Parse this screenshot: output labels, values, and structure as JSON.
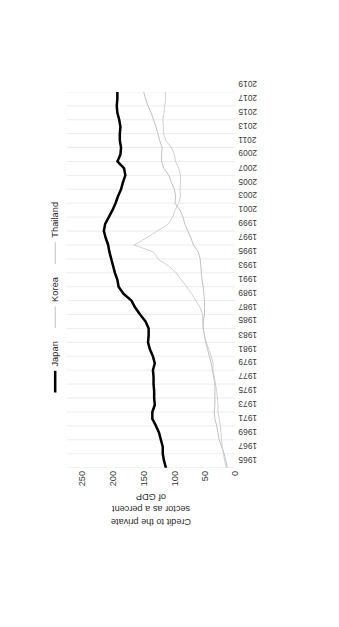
{
  "chart_data": {
    "type": "line",
    "title": "",
    "ylabel": "Credit to the private sector as a percent of GDP",
    "ylabel_lines": [
      "Credit to the private",
      "sector as a percent",
      "of GDP"
    ],
    "xlabel": "",
    "ylim": [
      0,
      275
    ],
    "yticks": [
      0,
      50,
      100,
      150,
      200,
      250
    ],
    "ytick_labels": [
      "0",
      "50",
      "100",
      "150",
      "200",
      "250"
    ],
    "grid": "vertical-light",
    "legend_position": "top-right",
    "rotation": "figure rotated 90 degrees counter-clockwise",
    "x": [
      1965,
      1966,
      1967,
      1968,
      1969,
      1970,
      1971,
      1972,
      1973,
      1974,
      1975,
      1976,
      1977,
      1978,
      1979,
      1980,
      1981,
      1982,
      1983,
      1984,
      1985,
      1986,
      1987,
      1988,
      1989,
      1990,
      1991,
      1992,
      1993,
      1994,
      1995,
      1996,
      1997,
      1998,
      1999,
      2000,
      2001,
      2002,
      2003,
      2004,
      2005,
      2006,
      2007,
      2008,
      2009,
      2010,
      2011,
      2012,
      2013,
      2014,
      2015,
      2016,
      2017,
      2018,
      2019
    ],
    "xtick_labels": [
      "1965",
      "1967",
      "1969",
      "1971",
      "1973",
      "1975",
      "1977",
      "1979",
      "1981",
      "1983",
      "1985",
      "1987",
      "1989",
      "1991",
      "1993",
      "1995",
      "1997",
      "1999",
      "2001",
      "2003",
      "2005",
      "2007",
      "2009",
      "2011",
      "2013",
      "2015",
      "2017",
      "2019"
    ],
    "series": [
      {
        "name": "Japan",
        "color": "#000000",
        "width": 3,
        "values": [
          113,
          116,
          118,
          118,
          121,
          124,
          129,
          135,
          135,
          131,
          132,
          132,
          133,
          133,
          134,
          131,
          134,
          139,
          142,
          141,
          141,
          146,
          155,
          163,
          169,
          182,
          190,
          192,
          196,
          199,
          202,
          205,
          207,
          211,
          214,
          212,
          206,
          200,
          195,
          191,
          186,
          183,
          179,
          181,
          192,
          187,
          186,
          188,
          188,
          187,
          189,
          192,
          193,
          192,
          192
        ]
      },
      {
        "name": "Korea",
        "color": "#b4b4b4",
        "width": 1,
        "values": [
          13,
          15,
          18,
          22,
          26,
          28,
          30,
          33,
          34,
          33,
          33,
          33,
          33,
          35,
          37,
          39,
          42,
          45,
          48,
          50,
          52,
          52,
          50,
          50,
          50,
          51,
          52,
          54,
          55,
          56,
          57,
          60,
          68,
          72,
          77,
          82,
          85,
          90,
          98,
          97,
          99,
          104,
          108,
          116,
          120,
          120,
          119,
          123,
          126,
          129,
          133,
          137,
          142,
          146,
          149
        ]
      },
      {
        "name": "Thailand",
        "color": "#c8c8c8",
        "width": 1,
        "values": [
          15,
          17,
          19,
          21,
          22,
          23,
          24,
          26,
          28,
          28,
          29,
          30,
          32,
          34,
          36,
          36,
          39,
          43,
          47,
          50,
          52,
          53,
          53,
          57,
          64,
          71,
          79,
          88,
          96,
          109,
          126,
          133,
          165,
          145,
          127,
          109,
          102,
          98,
          92,
          89,
          90,
          89,
          89,
          92,
          97,
          99,
          104,
          113,
          117,
          117,
          118,
          116,
          115,
          113,
          114
        ]
      }
    ]
  },
  "legend": {
    "entries": [
      {
        "label": "Japan",
        "style": "thick"
      },
      {
        "label": "Korea",
        "style": "thin"
      },
      {
        "label": "Thailand",
        "style": "thin"
      }
    ]
  },
  "colors": {
    "japan": "#000000",
    "korea": "#b4b4b4",
    "thailand": "#c8c8c8",
    "grid": "#e9e9e9",
    "text": "#3a3a3a",
    "background": "#ffffff"
  }
}
